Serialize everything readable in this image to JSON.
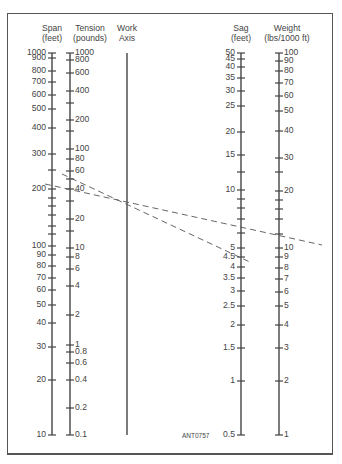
{
  "chart_data": {
    "type": "nomograph",
    "figure_code": "ANT0757",
    "axes": [
      {
        "name": "Span",
        "unit": "(feet)",
        "scale": "log",
        "range": [
          10,
          1000
        ],
        "labels": [
          "1000",
          "900",
          "800",
          "700",
          "600",
          "500",
          "400",
          "300",
          "200",
          "100",
          "90",
          "80",
          "70",
          "60",
          "50",
          "40",
          "30",
          "20",
          "10"
        ]
      },
      {
        "name": "Tension",
        "unit": "(pounds)",
        "scale": "log",
        "range": [
          0.1,
          1000
        ],
        "labels": [
          "1000",
          "800",
          "600",
          "400",
          "200",
          "100",
          "80",
          "60",
          "40",
          "20",
          "10",
          "8",
          "6",
          "4",
          "2",
          "1",
          "0.8",
          "0.6",
          "0.4",
          "0.2",
          "0.1"
        ]
      },
      {
        "name": "Work",
        "unit": "Axis",
        "scale": "none",
        "labels": []
      },
      {
        "name": "Sag",
        "unit": "(feet)",
        "scale": "log",
        "range": [
          0.5,
          50
        ],
        "labels": [
          "50",
          "45",
          "40",
          "35",
          "30",
          "25",
          "20",
          "15",
          "10",
          "5",
          "4.5",
          "4",
          "3.5",
          "3",
          "2.5",
          "2",
          "1.5",
          "1",
          "0.5"
        ]
      },
      {
        "name": "Weight",
        "unit": "(lbs/1000 ft)",
        "scale": "log",
        "range": [
          1,
          100
        ],
        "labels": [
          "100",
          "90",
          "80",
          "70",
          "60",
          "50",
          "40",
          "30",
          "20",
          "10",
          "9",
          "8",
          "7",
          "6",
          "5",
          "4",
          "3",
          "2",
          "1"
        ]
      }
    ],
    "example_lines": [
      {
        "style": "dashed",
        "from": "Span ≈ 210 ft",
        "through": "Work Axis",
        "to": "Weight ≈ 10.5 lbs/1000 ft",
        "note": "crosses Sag ≈ 6"
      },
      {
        "style": "dashed",
        "from": "Tension ≈ 50 lb",
        "through": "Work Axis",
        "to": "Sag ≈ 4.4 ft"
      }
    ]
  },
  "headers": {
    "span": {
      "name": "Span",
      "unit": "(feet)"
    },
    "tension": {
      "name": "Tension",
      "unit": "(pounds)"
    },
    "work": {
      "name": "Work",
      "unit": "Axis"
    },
    "sag": {
      "name": "Sag",
      "unit": "(feet)"
    },
    "weight": {
      "name": "Weight",
      "unit": "(lbs/1000 ft)"
    }
  },
  "span_ticks": [
    {
      "v": "1000",
      "y": 53
    },
    {
      "v": "900",
      "y": 58
    },
    {
      "v": "800",
      "y": 71
    },
    {
      "v": "700",
      "y": 82
    },
    {
      "v": "600",
      "y": 95
    },
    {
      "v": "500",
      "y": 109
    },
    {
      "v": "400",
      "y": 128
    },
    {
      "v": "300",
      "y": 154
    },
    {
      "v": "",
      "y": 170
    },
    {
      "v": "200",
      "y": 189
    },
    {
      "v": "",
      "y": 198
    },
    {
      "v": "",
      "y": 206
    },
    {
      "v": "",
      "y": 215
    },
    {
      "v": "",
      "y": 226
    },
    {
      "v": "",
      "y": 234
    },
    {
      "v": "100",
      "y": 246
    },
    {
      "v": "90",
      "y": 255
    },
    {
      "v": "80",
      "y": 266
    },
    {
      "v": "70",
      "y": 278
    },
    {
      "v": "60",
      "y": 290
    },
    {
      "v": "50",
      "y": 305
    },
    {
      "v": "40",
      "y": 323
    },
    {
      "v": "30",
      "y": 347
    },
    {
      "v": "20",
      "y": 380
    },
    {
      "v": "10",
      "y": 435
    }
  ],
  "tension_ticks": [
    {
      "v": "1000",
      "y": 53
    },
    {
      "v": "800",
      "y": 60
    },
    {
      "v": "600",
      "y": 73
    },
    {
      "v": "400",
      "y": 91
    },
    {
      "v": "",
      "y": 103
    },
    {
      "v": "200",
      "y": 120
    },
    {
      "v": "",
      "y": 131
    },
    {
      "v": "100",
      "y": 149
    },
    {
      "v": "80",
      "y": 159
    },
    {
      "v": "60",
      "y": 171
    },
    {
      "v": "",
      "y": 179
    },
    {
      "v": "40",
      "y": 189
    },
    {
      "v": "",
      "y": 201
    },
    {
      "v": "20",
      "y": 219
    },
    {
      "v": "",
      "y": 231
    },
    {
      "v": "10",
      "y": 248
    },
    {
      "v": "8",
      "y": 257
    },
    {
      "v": "6",
      "y": 269
    },
    {
      "v": "4",
      "y": 286
    },
    {
      "v": "2",
      "y": 315
    },
    {
      "v": "1",
      "y": 345
    },
    {
      "v": "0.8",
      "y": 352
    },
    {
      "v": "0.6",
      "y": 363
    },
    {
      "v": "0.4",
      "y": 380
    },
    {
      "v": "0.2",
      "y": 408
    },
    {
      "v": "0.1",
      "y": 435
    }
  ],
  "sag_ticks": [
    {
      "v": "50",
      "y": 53
    },
    {
      "v": "45",
      "y": 59
    },
    {
      "v": "40",
      "y": 67
    },
    {
      "v": "35",
      "y": 78
    },
    {
      "v": "30",
      "y": 91
    },
    {
      "v": "25",
      "y": 106
    },
    {
      "v": "20",
      "y": 132
    },
    {
      "v": "15",
      "y": 155
    },
    {
      "v": "",
      "y": 172
    },
    {
      "v": "10",
      "y": 190
    },
    {
      "v": "",
      "y": 199
    },
    {
      "v": "",
      "y": 208
    },
    {
      "v": "",
      "y": 219
    },
    {
      "v": "",
      "y": 233
    },
    {
      "v": "5",
      "y": 248
    },
    {
      "v": "4.5",
      "y": 257
    },
    {
      "v": "4",
      "y": 267
    },
    {
      "v": "3.5",
      "y": 278
    },
    {
      "v": "3",
      "y": 291
    },
    {
      "v": "2.5",
      "y": 306
    },
    {
      "v": "2",
      "y": 325
    },
    {
      "v": "1.5",
      "y": 348
    },
    {
      "v": "1",
      "y": 381
    },
    {
      "v": "0.5",
      "y": 435
    }
  ],
  "weight_ticks": [
    {
      "v": "100",
      "y": 53
    },
    {
      "v": "90",
      "y": 61
    },
    {
      "v": "80",
      "y": 71
    },
    {
      "v": "70",
      "y": 83
    },
    {
      "v": "60",
      "y": 96
    },
    {
      "v": "50",
      "y": 111
    },
    {
      "v": "40",
      "y": 131
    },
    {
      "v": "30",
      "y": 158
    },
    {
      "v": "",
      "y": 172
    },
    {
      "v": "20",
      "y": 191
    },
    {
      "v": "",
      "y": 200
    },
    {
      "v": "",
      "y": 209
    },
    {
      "v": "",
      "y": 219
    },
    {
      "v": "",
      "y": 234
    },
    {
      "v": "10",
      "y": 248
    },
    {
      "v": "9",
      "y": 257
    },
    {
      "v": "8",
      "y": 268
    },
    {
      "v": "7",
      "y": 279
    },
    {
      "v": "6",
      "y": 292
    },
    {
      "v": "5",
      "y": 306
    },
    {
      "v": "4",
      "y": 325
    },
    {
      "v": "3",
      "y": 348
    },
    {
      "v": "2",
      "y": 381
    },
    {
      "v": "1",
      "y": 435
    }
  ],
  "colors": {
    "axis": "#444444",
    "text": "#444444",
    "dash": "#555555",
    "frame": "#555555"
  },
  "footer": {
    "code": "ANT0757"
  }
}
